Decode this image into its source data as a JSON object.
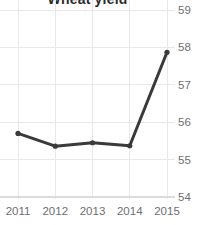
{
  "chart_data": {
    "type": "line",
    "title": "Wheat yield",
    "xlabel": "",
    "ylabel": "",
    "categories": [
      "2011",
      "2012",
      "2013",
      "2014",
      "2015"
    ],
    "x": [
      2011,
      2012,
      2013,
      2014,
      2015
    ],
    "values": [
      55.7,
      55.36,
      55.45,
      55.37,
      57.87
    ],
    "series": [
      {
        "name": "Wheat yield",
        "values": [
          55.7,
          55.36,
          55.45,
          55.37,
          57.87
        ],
        "color": "#3a3a3c"
      }
    ],
    "ylim": [
      54,
      59
    ],
    "xlim": [
      2011,
      2015
    ],
    "y_ticks": [
      59,
      58,
      57,
      56,
      55,
      54
    ],
    "y_tick_labels": [
      "59",
      "58",
      "57",
      "56",
      "55",
      "54"
    ],
    "x_ticks": [
      2011,
      2012,
      2013,
      2014,
      2015
    ],
    "x_tick_labels": [
      "2011",
      "2012",
      "2013",
      "2014",
      "2015"
    ],
    "grid": true,
    "grid_color": "#e8e8ea",
    "legend": false,
    "legend_position": "none",
    "y_axis_side": "right",
    "marker": "circle",
    "annotations": []
  }
}
